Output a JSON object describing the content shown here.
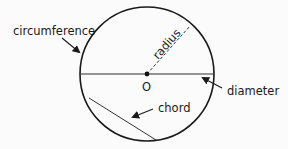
{
  "diagram": {
    "labels": {
      "circumference": "circumference",
      "radius": "radius",
      "center": "O",
      "diameter": "diameter",
      "chord": "chord"
    },
    "colors": {
      "stroke": "#1a1a1a",
      "line": "#333333",
      "background": "#fbfbfb"
    }
  }
}
